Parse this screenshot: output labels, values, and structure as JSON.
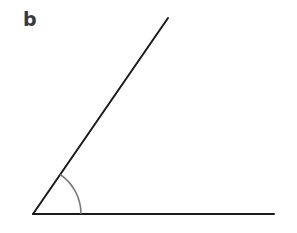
{
  "figure": {
    "label": "b",
    "vertex": [
      33,
      214
    ],
    "ray_end": [
      168,
      18
    ],
    "base_end": [
      274,
      214
    ],
    "arc_radius": 48,
    "line_color": "#1a1a1a",
    "arc_color": "#7a7a7a"
  }
}
